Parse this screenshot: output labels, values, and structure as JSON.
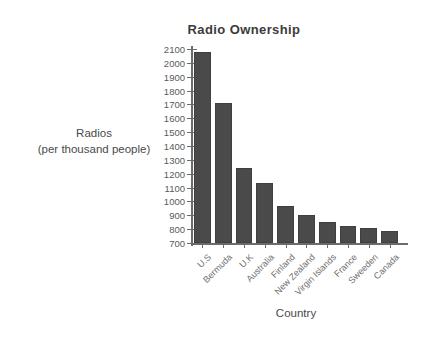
{
  "chart_data": {
    "type": "bar",
    "title": "Radio Ownership",
    "xlabel": "Country",
    "ylabel": "Radios\n(per thousand people)",
    "ylabel_line1": "Radios",
    "ylabel_line2": "(per thousand people)",
    "categories": [
      "U.S",
      "Bermuda",
      "U.K",
      "Australia",
      "Finland",
      "New Zealand",
      "Virgin Islands",
      "France",
      "Sweeden",
      "Canada"
    ],
    "values": [
      2080,
      1710,
      1240,
      1130,
      970,
      905,
      855,
      825,
      810,
      790
    ],
    "ylim": [
      700,
      2100
    ],
    "ytick_step": 100,
    "yticks": [
      2100,
      2000,
      1900,
      1800,
      1700,
      1600,
      1500,
      1400,
      1300,
      1200,
      1100,
      1000,
      900,
      800,
      700
    ],
    "grid": false,
    "legend": false,
    "bar_color": "#4a4a4a",
    "axis_color": "#6b6b6b",
    "background": "#ffffff"
  }
}
